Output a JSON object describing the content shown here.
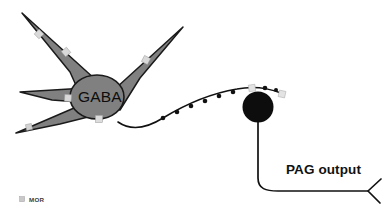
{
  "figure": {
    "background_color": "#ffffff",
    "type": "neuroscience-circuit-schematic"
  },
  "gaba_neuron": {
    "label": "GABA",
    "label_x": 78,
    "label_y": 102,
    "soma_fill": "#808080",
    "soma_stroke": "#1a1a1a",
    "soma_center_x": 97,
    "soma_center_y": 97,
    "soma_rx": 27,
    "soma_ry": 22,
    "dendrites": [
      {
        "name": "dendrite-upper-left",
        "tip_x": 22,
        "tip_y": 13
      },
      {
        "name": "dendrite-upper-right",
        "tip_x": 183,
        "tip_y": 27
      },
      {
        "name": "dendrite-lower-left",
        "tip_x": 16,
        "tip_y": 133
      },
      {
        "name": "dendrite-left",
        "tip_x": 20,
        "tip_y": 92
      }
    ]
  },
  "mor_receptors": {
    "marker_color": "#d9d9d9",
    "marker_stroke": "#9a9a9a",
    "on_dendrites": [
      {
        "x": 39,
        "y": 34,
        "r": -44
      },
      {
        "x": 66,
        "y": 52,
        "r": -40
      },
      {
        "x": 146,
        "y": 60,
        "r": 28
      },
      {
        "x": 68,
        "y": 98,
        "r": 4
      },
      {
        "x": 99,
        "y": 119,
        "r": 0
      }
    ],
    "on_axon": [
      {
        "x": 252,
        "y": 90,
        "r": -8
      },
      {
        "x": 282,
        "y": 94,
        "r": 10
      }
    ]
  },
  "axon": {
    "name": "gaba-axon",
    "stroke": "#111111",
    "stroke_width": 1.6,
    "path": "M 118 122 C 131 131, 147 128, 163 118 C 186 104, 213 93, 237 89 C 252 86, 268 88, 281 93",
    "boutons": {
      "fill": "#111111",
      "radius": 2.3,
      "points": [
        {
          "x": 163,
          "y": 118
        },
        {
          "x": 177,
          "y": 112
        },
        {
          "x": 191,
          "y": 106
        },
        {
          "x": 205,
          "y": 101
        },
        {
          "x": 219,
          "y": 96
        },
        {
          "x": 233,
          "y": 92
        },
        {
          "x": 265,
          "y": 88
        },
        {
          "x": 275,
          "y": 90
        }
      ]
    }
  },
  "pag_neuron": {
    "name": "pag-output-neuron-soma",
    "fill": "#0d0d0d",
    "center_x": 258,
    "center_y": 107,
    "radius": 15.5,
    "output_label": "PAG output",
    "output_label_x": 286,
    "output_label_y": 174,
    "output_stroke": "#111111",
    "output_stroke_width": 1.7,
    "output_path": "M 258 122 L 258 178 C 258 189, 266 191, 278 191 L 368 191",
    "terminal_path": "M 380 180 L 368 191 L 379 202"
  },
  "legend": {
    "name": "legend-mor",
    "marker_x": 20,
    "marker_y": 198,
    "marker_color": "#c9c9c9",
    "marker_stroke": "#a5a5a5",
    "label": "MOR",
    "label_x": 30,
    "label_y": 202
  }
}
